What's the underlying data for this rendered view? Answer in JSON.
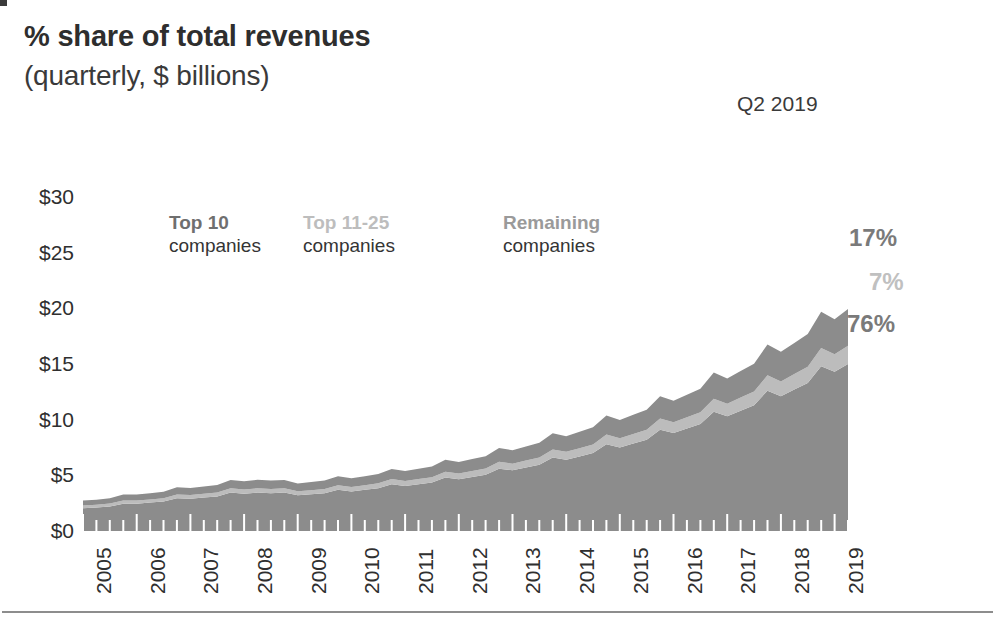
{
  "header": {
    "title": "% share of total revenues",
    "subtitle": "(quarterly, $ billions)",
    "period": "Q2 2019"
  },
  "legend": [
    {
      "title": "Top 10",
      "subtitle": "companies",
      "color": "#6f6f6f"
    },
    {
      "title": "Top 11-25",
      "subtitle": "companies",
      "color": "#bdbdbd"
    },
    {
      "title": "Remaining",
      "subtitle": "companies",
      "color": "#9a9a9a"
    }
  ],
  "callouts": [
    {
      "value": "17%",
      "color": "#7a7a7a"
    },
    {
      "value": "7%",
      "color": "#c0c0c0"
    },
    {
      "value": "76%",
      "color": "#7a7a7a"
    }
  ],
  "colors": {
    "band_top10": "#8c8c8c",
    "band_top11_25": "#bcbcbc",
    "band_remaining": "#8c8c8c",
    "axis_text": "#2f2f2f",
    "rule": "#8d8d8d",
    "tick": "#ffffff"
  },
  "chart_data": {
    "type": "area",
    "stacked": true,
    "title": "% share of total revenues",
    "subtitle": "(quarterly, $ billions)",
    "xlabel": "",
    "ylabel": "",
    "ylim": [
      0,
      30
    ],
    "yticks": [
      0,
      5,
      10,
      15,
      20,
      25,
      30
    ],
    "ytick_labels": [
      "$0",
      "$5",
      "$10",
      "$15",
      "$20",
      "$25",
      "$30"
    ],
    "xtick_labels": [
      "2005",
      "2006",
      "2007",
      "2008",
      "2009",
      "2010",
      "2011",
      "2012",
      "2013",
      "2014",
      "2015",
      "2016",
      "2017",
      "2018",
      "2019"
    ],
    "x_start_year": 2005,
    "x_period": "quarterly",
    "grid": false,
    "legend_position": "inside-top",
    "annotations": [
      {
        "text": "Q2 2019",
        "position": "top-right"
      },
      {
        "text": "17%",
        "series": "Remaining companies",
        "position": "right-end"
      },
      {
        "text": "7%",
        "series": "Top 11-25 companies",
        "position": "right-end"
      },
      {
        "text": "76%",
        "series": "Top 10 companies",
        "position": "right-end"
      }
    ],
    "x": [
      "2005 Q1",
      "2005 Q2",
      "2005 Q3",
      "2005 Q4",
      "2006 Q1",
      "2006 Q2",
      "2006 Q3",
      "2006 Q4",
      "2007 Q1",
      "2007 Q2",
      "2007 Q3",
      "2007 Q4",
      "2008 Q1",
      "2008 Q2",
      "2008 Q3",
      "2008 Q4",
      "2009 Q1",
      "2009 Q2",
      "2009 Q3",
      "2009 Q4",
      "2010 Q1",
      "2010 Q2",
      "2010 Q3",
      "2010 Q4",
      "2011 Q1",
      "2011 Q2",
      "2011 Q3",
      "2011 Q4",
      "2012 Q1",
      "2012 Q2",
      "2012 Q3",
      "2012 Q4",
      "2013 Q1",
      "2013 Q2",
      "2013 Q3",
      "2013 Q4",
      "2014 Q1",
      "2014 Q2",
      "2014 Q3",
      "2014 Q4",
      "2015 Q1",
      "2015 Q2",
      "2015 Q3",
      "2015 Q4",
      "2016 Q1",
      "2016 Q2",
      "2016 Q3",
      "2016 Q4",
      "2017 Q1",
      "2017 Q2",
      "2017 Q3",
      "2017 Q4",
      "2018 Q1",
      "2018 Q2",
      "2018 Q3",
      "2018 Q4",
      "2019 Q1",
      "2019 Q2"
    ],
    "series": [
      {
        "name": "Top 10 companies",
        "color": "#8c8c8c",
        "final_share_pct": 76,
        "values": [
          2.05,
          2.1,
          2.2,
          2.45,
          2.45,
          2.55,
          2.65,
          2.95,
          2.9,
          3.0,
          3.1,
          3.45,
          3.35,
          3.45,
          3.4,
          3.45,
          3.2,
          3.3,
          3.4,
          3.7,
          3.55,
          3.7,
          3.85,
          4.2,
          4.05,
          4.2,
          4.35,
          4.8,
          4.65,
          4.85,
          5.05,
          5.6,
          5.45,
          5.7,
          5.95,
          6.6,
          6.4,
          6.7,
          7.0,
          7.8,
          7.5,
          7.85,
          8.2,
          9.1,
          8.8,
          9.2,
          9.6,
          10.7,
          10.3,
          10.8,
          11.3,
          12.6,
          12.1,
          12.7,
          13.3,
          14.8,
          14.3,
          15.0
        ]
      },
      {
        "name": "Top 11-25 companies",
        "color": "#bcbcbc",
        "final_share_pct": 7,
        "values": [
          0.25,
          0.25,
          0.26,
          0.28,
          0.28,
          0.29,
          0.3,
          0.33,
          0.33,
          0.34,
          0.35,
          0.38,
          0.38,
          0.39,
          0.38,
          0.38,
          0.36,
          0.37,
          0.38,
          0.41,
          0.4,
          0.41,
          0.43,
          0.46,
          0.45,
          0.47,
          0.48,
          0.53,
          0.52,
          0.54,
          0.56,
          0.62,
          0.6,
          0.63,
          0.66,
          0.73,
          0.71,
          0.74,
          0.77,
          0.86,
          0.83,
          0.87,
          0.9,
          1.0,
          0.97,
          1.01,
          1.06,
          1.18,
          1.13,
          1.19,
          1.24,
          1.38,
          1.33,
          1.4,
          1.46,
          1.63,
          1.57,
          1.65
        ]
      },
      {
        "name": "Remaining companies",
        "color": "#8c8c8c",
        "final_share_pct": 17,
        "values": [
          0.45,
          0.46,
          0.48,
          0.54,
          0.54,
          0.56,
          0.58,
          0.65,
          0.64,
          0.66,
          0.68,
          0.76,
          0.74,
          0.76,
          0.75,
          0.76,
          0.7,
          0.73,
          0.75,
          0.81,
          0.78,
          0.81,
          0.85,
          0.92,
          0.89,
          0.92,
          0.96,
          1.06,
          1.02,
          1.07,
          1.11,
          1.23,
          1.2,
          1.25,
          1.31,
          1.45,
          1.41,
          1.47,
          1.54,
          1.72,
          1.65,
          1.73,
          1.8,
          2.0,
          1.94,
          2.02,
          2.11,
          2.35,
          2.27,
          2.38,
          2.49,
          2.77,
          2.66,
          2.79,
          2.93,
          3.26,
          3.15,
          3.3
        ]
      }
    ]
  }
}
